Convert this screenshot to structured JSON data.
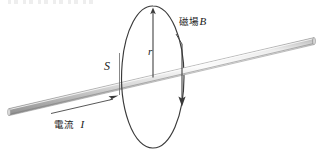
{
  "figure": {
    "width": 323,
    "height": 157,
    "background_color": "#ffffff",
    "stroke_color": "#333333",
    "rod_fill_light": "#f2f2f2",
    "rod_fill_mid": "#c9c9c9",
    "rod_fill_dark": "#9a9a9a"
  },
  "labels": {
    "magnetic_field": "磁場",
    "magnetic_field_symbol": "B",
    "current": "電流",
    "current_symbol": "I",
    "area_symbol": "S",
    "radius_symbol": "r"
  },
  "geometry": {
    "ellipse": {
      "cx": 153,
      "cy": 77,
      "rx": 31,
      "ry": 71
    },
    "rod": {
      "x1": 9,
      "y1": 112,
      "x2": 314,
      "y2": 41,
      "thickness": 7
    },
    "radius_arrow": {
      "x1": 153,
      "y1": 77,
      "x2": 153,
      "y2": 9
    },
    "b_arrow": {
      "x1": 182,
      "y1": 50,
      "x2": 182,
      "y2": 105
    },
    "current_arrow": {
      "x": 117,
      "y": 97
    },
    "current_underline": {
      "x1": 51,
      "y1": 113,
      "x2": 117,
      "y2": 113
    }
  },
  "icons": {
    "arrow_up": "radius-arrow-icon",
    "arrow_down": "b-field-arrow-icon",
    "arrow_right": "current-arrow-icon"
  }
}
